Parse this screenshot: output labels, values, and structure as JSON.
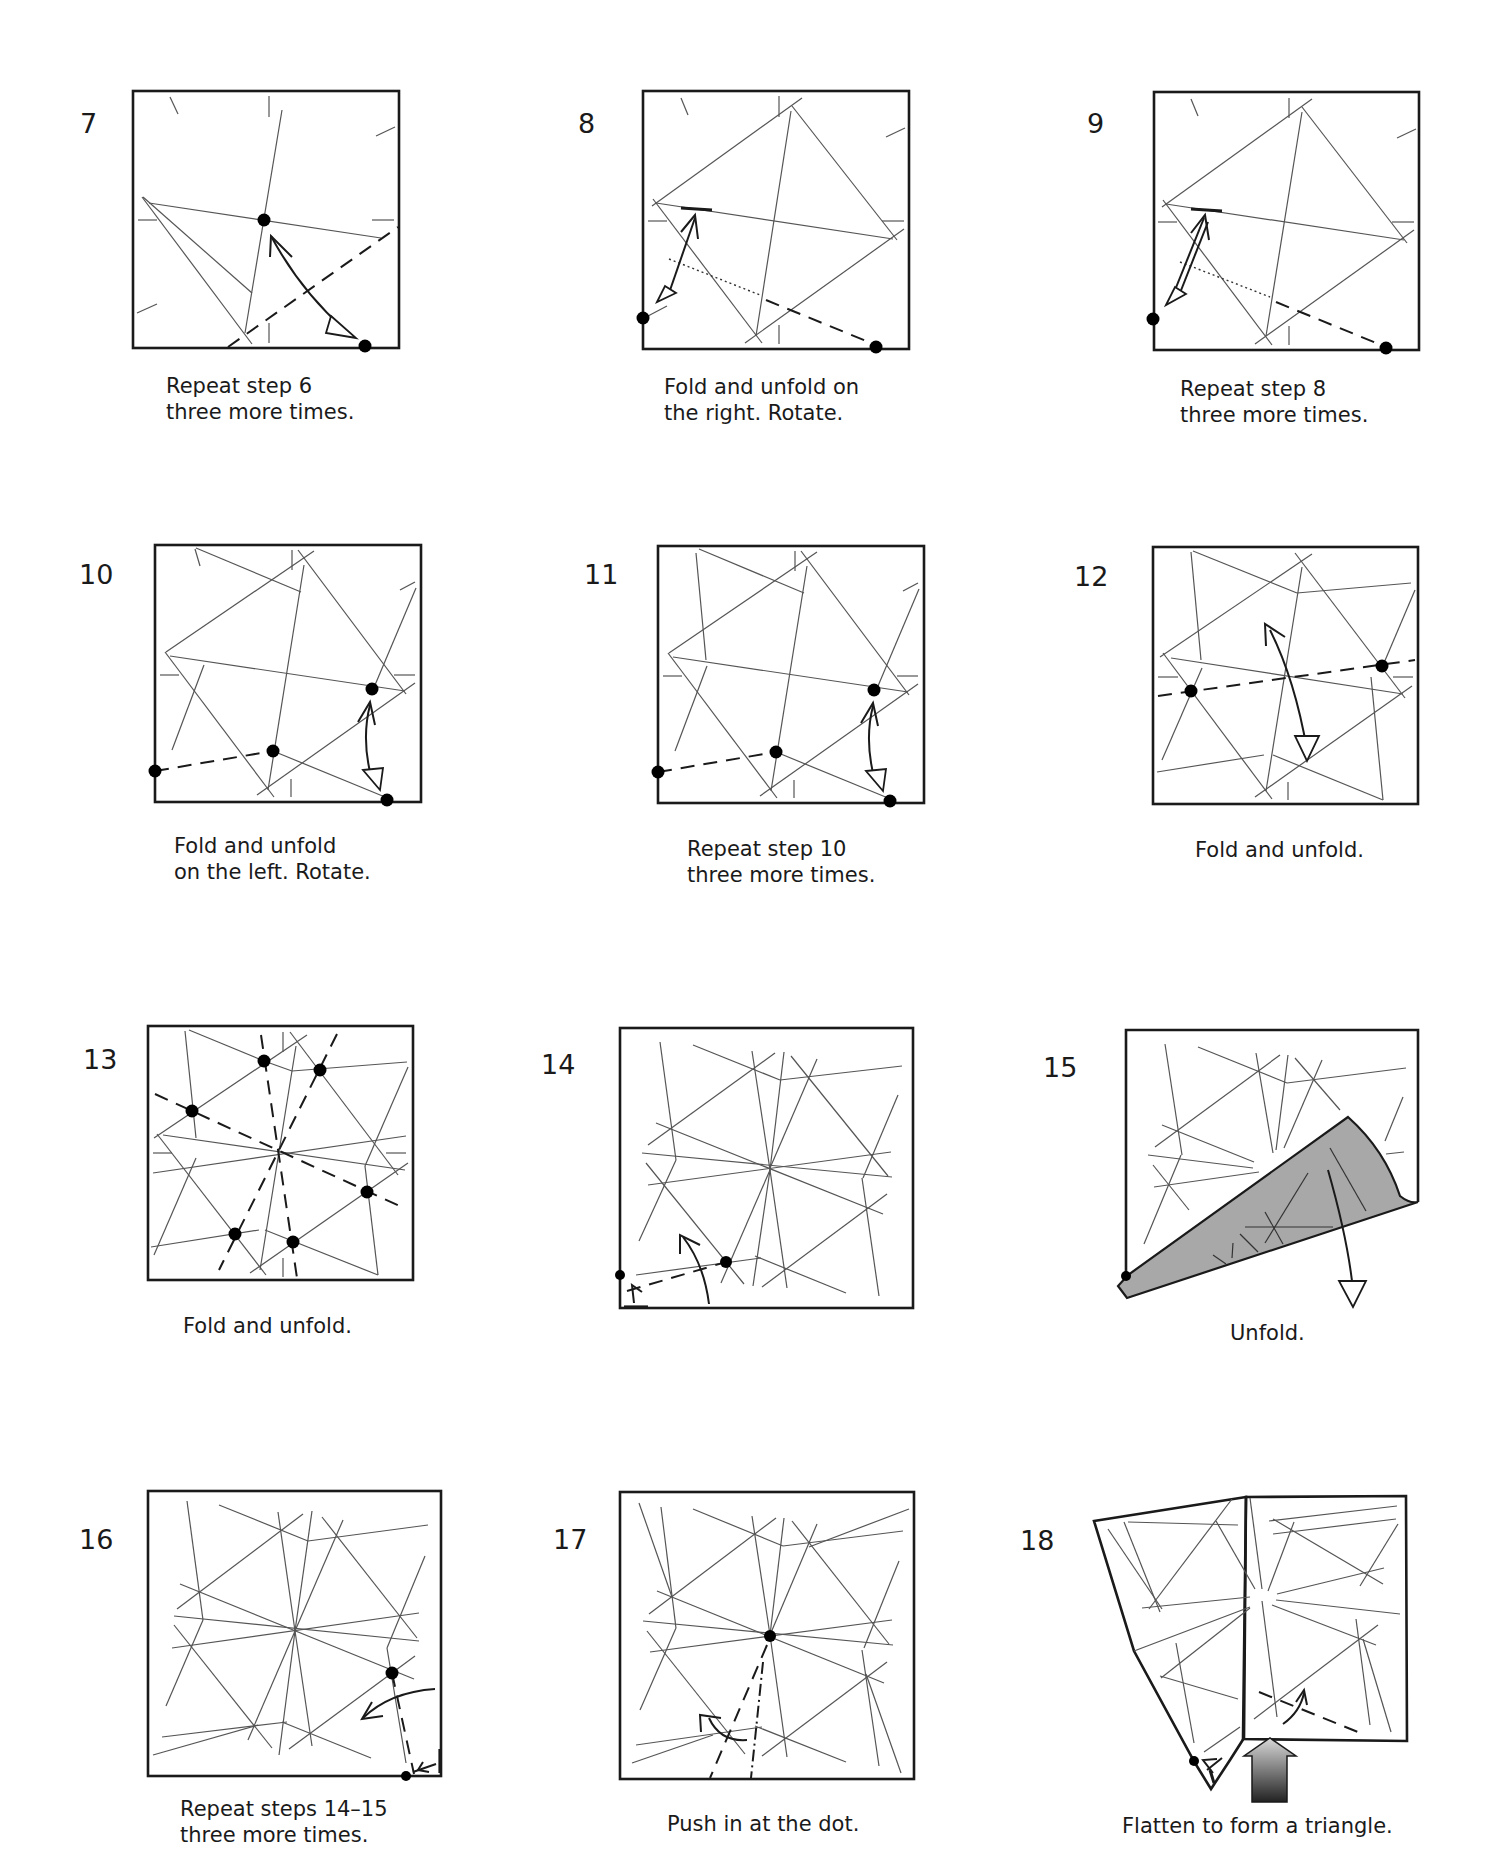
{
  "document": {
    "type": "origami instruction diagrams",
    "steps": [
      {
        "number": "7",
        "caption_lines": [
          "Repeat step 6",
          "three more times."
        ]
      },
      {
        "number": "8",
        "caption_lines": [
          "Fold and unfold on",
          "the right. Rotate."
        ]
      },
      {
        "number": "9",
        "caption_lines": [
          "Repeat step 8",
          "three more times."
        ]
      },
      {
        "number": "10",
        "caption_lines": [
          "Fold and unfold",
          "on the left. Rotate."
        ]
      },
      {
        "number": "11",
        "caption_lines": [
          "Repeat step 10",
          "three more times."
        ]
      },
      {
        "number": "12",
        "caption_lines": [
          "Fold and unfold."
        ]
      },
      {
        "number": "13",
        "caption_lines": [
          "Fold and unfold."
        ]
      },
      {
        "number": "14",
        "caption_lines": []
      },
      {
        "number": "15",
        "caption_lines": [
          "Unfold."
        ]
      },
      {
        "number": "16",
        "caption_lines": [
          "Repeat steps 14–15",
          "three more times."
        ]
      },
      {
        "number": "17",
        "caption_lines": [
          "Push in at the dot."
        ]
      },
      {
        "number": "18",
        "caption_lines": [
          "Flatten to form a triangle."
        ]
      }
    ]
  },
  "colors": {
    "paper": "#ffffff",
    "line": "#1a1a1a",
    "crease": "#555555",
    "flap_fill": "#a8a8a8"
  },
  "icons": {
    "valley_fold": "dashed-line",
    "mountain_fold": "dash-dot-line",
    "fold_unfold_arrow": "double-headed-arrow",
    "push_arrow": "large-gradient-arrow",
    "reference_dot": "filled-circle"
  }
}
